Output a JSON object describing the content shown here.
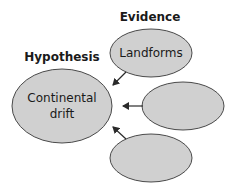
{
  "diagram": {
    "type": "concept-map",
    "headings": {
      "evidence": "Evidence",
      "hypothesis": "Hypothesis"
    },
    "hypothesis_node": {
      "line1": "Continental",
      "line2": "drift"
    },
    "evidence_nodes": [
      {
        "label": "Landforms"
      },
      {
        "label": ""
      },
      {
        "label": ""
      }
    ],
    "colors": {
      "node_fill": "#d0d0d0",
      "node_stroke": "#4a4a4a",
      "text": "#1a1a1a"
    }
  }
}
